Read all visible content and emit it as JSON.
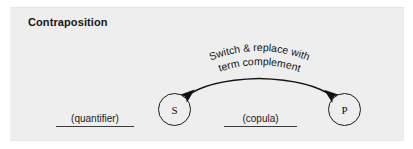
{
  "figure": {
    "title": "Contraposition",
    "background_color": "#eeeeee",
    "ink_color": "#1b1b1b"
  },
  "diagram": {
    "type": "logic-operation-diagram",
    "nodes": [
      {
        "id": "subject",
        "label": "S",
        "cx": 174.5,
        "cy": 109.5,
        "r": 16.5
      },
      {
        "id": "predicate",
        "label": "P",
        "cx": 344.5,
        "cy": 109.5,
        "r": 16.5
      }
    ],
    "slots": [
      {
        "id": "quantifier",
        "label": "(quantifier)",
        "underlined": true
      },
      {
        "id": "copula",
        "label": "(copula)",
        "underlined": true
      }
    ],
    "arc": {
      "style": "double-headed-curved-arrow",
      "from": "predicate",
      "to": "subject",
      "bidirectional": true,
      "label_line_1": "Switch & replace with",
      "label_line_2": "term complement"
    }
  }
}
